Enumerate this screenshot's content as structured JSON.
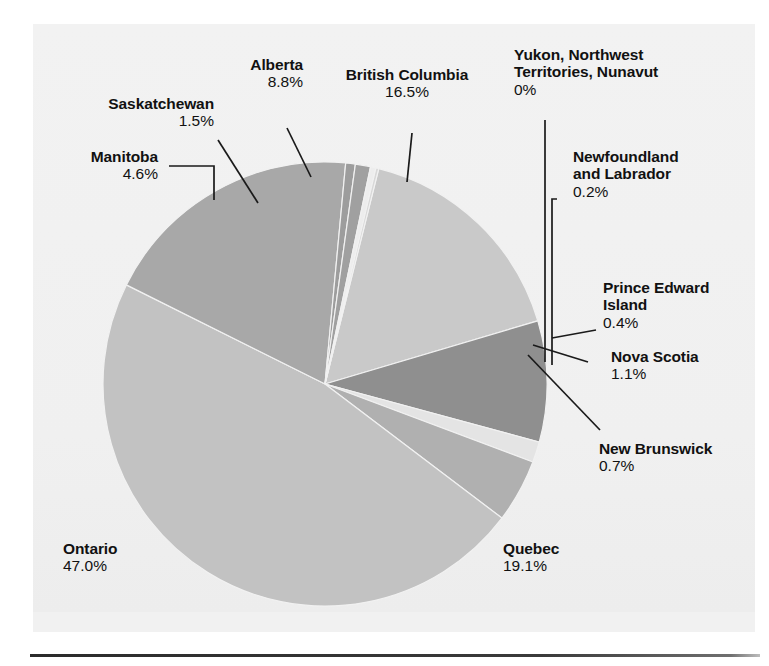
{
  "chart_data": {
    "type": "pie",
    "title": "",
    "subtitle": "",
    "xlabel": "",
    "ylabel": "",
    "legend_position": "labels-with-leader-lines",
    "grid": false,
    "units": "percent",
    "categories": [
      "British Columbia",
      "Alberta",
      "Saskatchewan",
      "Manitoba",
      "Ontario",
      "Quebec",
      "New Brunswick",
      "Nova Scotia",
      "Prince Edward Island",
      "Newfoundland and Labrador",
      "Yukon, Northwest Territories, Nunavut"
    ],
    "values": [
      16.5,
      8.8,
      1.5,
      4.6,
      47.0,
      19.1,
      0.7,
      1.1,
      0.4,
      0.2,
      0.0
    ],
    "value_labels": [
      "16.5%",
      "8.8%",
      "1.5%",
      "4.6%",
      "47.0%",
      "19.1%",
      "0.7%",
      "1.1%",
      "0.4%",
      "0.2%",
      "0%"
    ],
    "slice_colors": [
      "#c9c9c9",
      "#8f8f8f",
      "#e4e4e4",
      "#b0b0b0",
      "#c2c2c2",
      "#a8a8a8",
      "#9d9d9d",
      "#a0a0a0",
      "#ededed",
      "#d8d8d8",
      "#f0f0f0"
    ],
    "total": 99.9
  },
  "slices": [
    {
      "name": "British Columbia",
      "percent_label": "16.5%",
      "value": 16.5,
      "color": "#c9c9c9"
    },
    {
      "name": "Alberta",
      "percent_label": "8.8%",
      "value": 8.8,
      "color": "#8f8f8f"
    },
    {
      "name": "Saskatchewan",
      "percent_label": "1.5%",
      "value": 1.5,
      "color": "#e4e4e4"
    },
    {
      "name": "Manitoba",
      "percent_label": "4.6%",
      "value": 4.6,
      "color": "#b0b0b0"
    },
    {
      "name": "Ontario",
      "percent_label": "47.0%",
      "value": 47.0,
      "color": "#c2c2c2"
    },
    {
      "name": "Quebec",
      "percent_label": "19.1%",
      "value": 19.1,
      "color": "#a8a8a8"
    },
    {
      "name": "New Brunswick",
      "percent_label": "0.7%",
      "value": 0.7,
      "color": "#9d9d9d"
    },
    {
      "name": "Nova Scotia",
      "percent_label": "1.1%",
      "value": 1.1,
      "color": "#a0a0a0"
    },
    {
      "name": "Prince Edward Island",
      "percent_label": "0.4%",
      "value": 0.4,
      "color": "#ededed"
    },
    {
      "name": "Newfoundland and Labrador",
      "percent_label": "0.2%",
      "value": 0.2,
      "color": "#d8d8d8"
    },
    {
      "name": "Yukon, Northwest Territories, Nunavut",
      "percent_label": "0%",
      "value": 0.0,
      "color": "#f0f0f0"
    }
  ],
  "labels": {
    "saskatchewan": {
      "name": "Saskatchewan",
      "percent": "1.5%"
    },
    "alberta": {
      "name": "Alberta",
      "percent": "8.8%"
    },
    "british_columbia": {
      "name": "British Columbia",
      "percent": "16.5%"
    },
    "territories": {
      "name": "Yukon, Northwest\nTerritories, Nunavut",
      "percent": "0%"
    },
    "manitoba": {
      "name": "Manitoba",
      "percent": "4.6%"
    },
    "newfoundland": {
      "name": "Newfoundland\nand Labrador",
      "percent": "0.2%"
    },
    "pei": {
      "name": "Prince Edward\nIsland",
      "percent": "0.4%"
    },
    "nova_scotia": {
      "name": "Nova Scotia",
      "percent": "1.1%"
    },
    "new_brunswick": {
      "name": "New Brunswick",
      "percent": "0.7%"
    },
    "ontario": {
      "name": "Ontario",
      "percent": "47.0%"
    },
    "quebec": {
      "name": "Quebec",
      "percent": "19.1%"
    }
  },
  "colors": {
    "background": "#ffffff",
    "panel": "#f1f1f1",
    "text": "#111111",
    "leader_line": "#1a1a1a",
    "rule": "#2b2b2b"
  }
}
